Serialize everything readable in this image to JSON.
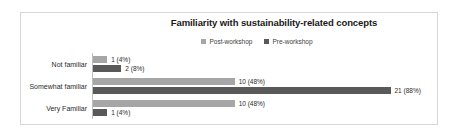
{
  "chart_data": {
    "type": "bar",
    "orientation": "horizontal",
    "title": "Familiarity with sustainability-related concepts",
    "xlabel": "",
    "ylabel": "",
    "grid": false,
    "legend_position": "top-center",
    "categories": [
      "Not familiar",
      "Somewhat familiar",
      "Very Familiar"
    ],
    "xlim": [
      0,
      24
    ],
    "series": [
      {
        "name": "Post-workshop",
        "color": "#a6a6a6",
        "values": [
          1,
          10,
          10
        ],
        "percents": [
          "4%",
          "48%",
          "48%"
        ],
        "labels": [
          "1 (4%)",
          "10 (48%)",
          "10 (48%)"
        ]
      },
      {
        "name": "Pre-workshop",
        "color": "#595959",
        "values": [
          2,
          21,
          1
        ],
        "percents": [
          "8%",
          "88%",
          "4%"
        ],
        "labels": [
          "2 (8%)",
          "21 (88%)",
          "1 (4%)"
        ]
      }
    ]
  },
  "colors": {
    "post_workshop": "#a6a6a6",
    "pre_workshop": "#595959",
    "frame_border": "#d6d6d6",
    "axis": "#bfbfbf",
    "text": "#2b2b2b",
    "background": "#ffffff"
  }
}
